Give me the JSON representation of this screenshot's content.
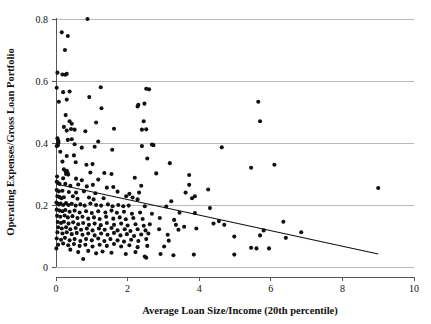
{
  "chart_data": {
    "type": "scatter",
    "title": "",
    "xlabel": "Average Loan Size/Income (20th percentile)",
    "ylabel": "Operating Expenses/Gross Loan Portfolio",
    "xlim": [
      0,
      10
    ],
    "ylim": [
      0,
      0.8
    ],
    "xticks": [
      0,
      2,
      4,
      6,
      8,
      10
    ],
    "yticks": [
      0,
      0.2,
      0.4,
      0.6,
      0.8
    ],
    "xtick_labels": [
      "0",
      "2",
      "4",
      "6",
      "8",
      "10"
    ],
    "ytick_labels": [
      "0",
      "0.2",
      "0.4",
      "0.6",
      "0.8"
    ],
    "grid": "horizontal",
    "legend": "none",
    "marker_color": "#111111",
    "marker_shape": "circle",
    "gridline_color": "#b8b8b8",
    "trendline": {
      "type": "linear-fit",
      "color": "#111111",
      "x_start": 0.0,
      "y_start": 0.268,
      "x_end": 9.0,
      "y_end": 0.042
    },
    "points": [
      [
        0.88,
        0.8
      ],
      [
        0.16,
        0.757
      ],
      [
        0.33,
        0.745
      ],
      [
        0.25,
        0.7
      ],
      [
        0.04,
        0.627
      ],
      [
        0.18,
        0.621
      ],
      [
        0.26,
        0.62
      ],
      [
        0.3,
        0.623
      ],
      [
        0.02,
        0.578
      ],
      [
        0.2,
        0.564
      ],
      [
        0.38,
        0.566
      ],
      [
        1.25,
        0.58
      ],
      [
        2.52,
        0.575
      ],
      [
        2.6,
        0.573
      ],
      [
        0.08,
        0.533
      ],
      [
        0.3,
        0.54
      ],
      [
        0.93,
        0.548
      ],
      [
        2.3,
        0.523
      ],
      [
        2.47,
        0.527
      ],
      [
        5.65,
        0.533
      ],
      [
        2.28,
        0.518
      ],
      [
        1.27,
        0.512
      ],
      [
        0.27,
        0.49
      ],
      [
        0.38,
        0.47
      ],
      [
        0.44,
        0.462
      ],
      [
        1.12,
        0.466
      ],
      [
        2.45,
        0.47
      ],
      [
        5.7,
        0.47
      ],
      [
        0.22,
        0.452
      ],
      [
        0.42,
        0.445
      ],
      [
        0.52,
        0.443
      ],
      [
        0.3,
        0.44
      ],
      [
        0.82,
        0.438
      ],
      [
        1.62,
        0.446
      ],
      [
        2.4,
        0.443
      ],
      [
        2.52,
        0.444
      ],
      [
        0.04,
        0.415
      ],
      [
        0.06,
        0.408
      ],
      [
        0.06,
        0.398
      ],
      [
        0.07,
        0.403
      ],
      [
        0.33,
        0.41
      ],
      [
        0.44,
        0.412
      ],
      [
        1.18,
        0.405
      ],
      [
        0.02,
        0.39
      ],
      [
        0.05,
        0.392
      ],
      [
        0.52,
        0.396
      ],
      [
        0.72,
        0.385
      ],
      [
        1.08,
        0.388
      ],
      [
        1.57,
        0.378
      ],
      [
        2.4,
        0.39
      ],
      [
        2.68,
        0.395
      ],
      [
        2.72,
        0.393
      ],
      [
        4.63,
        0.386
      ],
      [
        0.12,
        0.372
      ],
      [
        0.3,
        0.358
      ],
      [
        0.5,
        0.36
      ],
      [
        2.55,
        0.35
      ],
      [
        0.18,
        0.34
      ],
      [
        0.55,
        0.338
      ],
      [
        0.85,
        0.33
      ],
      [
        1.02,
        0.332
      ],
      [
        3.18,
        0.335
      ],
      [
        5.45,
        0.32
      ],
      [
        6.1,
        0.33
      ],
      [
        0.22,
        0.315
      ],
      [
        0.27,
        0.308
      ],
      [
        0.3,
        0.31
      ],
      [
        0.32,
        0.305
      ],
      [
        0.28,
        0.3
      ],
      [
        0.34,
        0.298
      ],
      [
        0.96,
        0.305
      ],
      [
        1.35,
        0.303
      ],
      [
        1.55,
        0.3
      ],
      [
        2.8,
        0.302
      ],
      [
        3.72,
        0.297
      ],
      [
        0.03,
        0.292
      ],
      [
        0.2,
        0.286
      ],
      [
        0.56,
        0.285
      ],
      [
        0.72,
        0.28
      ],
      [
        1.18,
        0.282
      ],
      [
        2.2,
        0.288
      ],
      [
        2.38,
        0.262
      ],
      [
        0.02,
        0.275
      ],
      [
        0.05,
        0.272
      ],
      [
        0.1,
        0.268
      ],
      [
        0.26,
        0.268
      ],
      [
        0.4,
        0.262
      ],
      [
        0.62,
        0.266
      ],
      [
        0.86,
        0.26
      ],
      [
        1.03,
        0.265
      ],
      [
        1.42,
        0.256
      ],
      [
        1.6,
        0.258
      ],
      [
        3.72,
        0.265
      ],
      [
        4.25,
        0.25
      ],
      [
        9.0,
        0.255
      ],
      [
        0.02,
        0.248
      ],
      [
        0.08,
        0.244
      ],
      [
        0.18,
        0.246
      ],
      [
        0.36,
        0.242
      ],
      [
        0.56,
        0.24
      ],
      [
        0.78,
        0.244
      ],
      [
        1.1,
        0.238
      ],
      [
        1.72,
        0.243
      ],
      [
        2.05,
        0.236
      ],
      [
        2.32,
        0.24
      ],
      [
        3.62,
        0.24
      ],
      [
        3.88,
        0.228
      ],
      [
        0.04,
        0.228
      ],
      [
        0.1,
        0.226
      ],
      [
        0.15,
        0.222
      ],
      [
        0.22,
        0.225
      ],
      [
        0.47,
        0.228
      ],
      [
        0.6,
        0.22
      ],
      [
        0.92,
        0.224
      ],
      [
        1.05,
        0.218
      ],
      [
        1.33,
        0.222
      ],
      [
        1.96,
        0.228
      ],
      [
        2.14,
        0.224
      ],
      [
        2.28,
        0.218
      ],
      [
        3.22,
        0.212
      ],
      [
        3.8,
        0.222
      ],
      [
        0.01,
        0.208
      ],
      [
        0.04,
        0.205
      ],
      [
        0.08,
        0.202
      ],
      [
        0.13,
        0.205
      ],
      [
        0.2,
        0.2
      ],
      [
        0.28,
        0.206
      ],
      [
        0.35,
        0.2
      ],
      [
        0.44,
        0.204
      ],
      [
        0.55,
        0.198
      ],
      [
        0.68,
        0.202
      ],
      [
        0.8,
        0.198
      ],
      [
        0.96,
        0.205
      ],
      [
        1.12,
        0.2
      ],
      [
        1.26,
        0.198
      ],
      [
        1.45,
        0.202
      ],
      [
        1.58,
        0.196
      ],
      [
        1.74,
        0.2
      ],
      [
        1.88,
        0.196
      ],
      [
        2.03,
        0.198
      ],
      [
        2.48,
        0.196
      ],
      [
        3.08,
        0.195
      ],
      [
        4.3,
        0.19
      ],
      [
        0.02,
        0.185
      ],
      [
        0.1,
        0.182
      ],
      [
        0.18,
        0.18
      ],
      [
        0.26,
        0.184
      ],
      [
        0.38,
        0.178
      ],
      [
        0.52,
        0.182
      ],
      [
        0.66,
        0.176
      ],
      [
        0.84,
        0.18
      ],
      [
        1.0,
        0.174
      ],
      [
        1.18,
        0.18
      ],
      [
        1.38,
        0.176
      ],
      [
        1.55,
        0.182
      ],
      [
        1.7,
        0.175
      ],
      [
        1.9,
        0.178
      ],
      [
        2.12,
        0.172
      ],
      [
        2.35,
        0.176
      ],
      [
        2.68,
        0.172
      ],
      [
        3.45,
        0.175
      ],
      [
        3.88,
        0.174
      ],
      [
        0.03,
        0.165
      ],
      [
        0.12,
        0.162
      ],
      [
        0.24,
        0.166
      ],
      [
        0.33,
        0.16
      ],
      [
        0.46,
        0.164
      ],
      [
        0.6,
        0.158
      ],
      [
        0.74,
        0.162
      ],
      [
        0.9,
        0.156
      ],
      [
        1.06,
        0.16
      ],
      [
        1.22,
        0.155
      ],
      [
        1.4,
        0.162
      ],
      [
        1.6,
        0.156
      ],
      [
        1.78,
        0.16
      ],
      [
        1.95,
        0.154
      ],
      [
        2.16,
        0.158
      ],
      [
        2.42,
        0.155
      ],
      [
        2.9,
        0.158
      ],
      [
        3.3,
        0.152
      ],
      [
        4.55,
        0.148
      ],
      [
        6.35,
        0.146
      ],
      [
        0.05,
        0.145
      ],
      [
        0.14,
        0.142
      ],
      [
        0.22,
        0.146
      ],
      [
        0.35,
        0.14
      ],
      [
        0.48,
        0.144
      ],
      [
        0.62,
        0.138
      ],
      [
        0.76,
        0.142
      ],
      [
        0.92,
        0.136
      ],
      [
        1.08,
        0.14
      ],
      [
        1.25,
        0.135
      ],
      [
        1.42,
        0.142
      ],
      [
        1.62,
        0.136
      ],
      [
        1.82,
        0.14
      ],
      [
        2.0,
        0.134
      ],
      [
        2.22,
        0.138
      ],
      [
        2.45,
        0.133
      ],
      [
        2.62,
        0.138
      ],
      [
        3.35,
        0.136
      ],
      [
        3.58,
        0.13
      ],
      [
        4.4,
        0.14
      ],
      [
        4.7,
        0.136
      ],
      [
        0.06,
        0.128
      ],
      [
        0.16,
        0.124
      ],
      [
        0.28,
        0.128
      ],
      [
        0.4,
        0.122
      ],
      [
        0.55,
        0.126
      ],
      [
        0.7,
        0.12
      ],
      [
        0.86,
        0.124
      ],
      [
        1.02,
        0.118
      ],
      [
        1.2,
        0.124
      ],
      [
        1.36,
        0.12
      ],
      [
        1.55,
        0.126
      ],
      [
        1.72,
        0.118
      ],
      [
        1.92,
        0.122
      ],
      [
        2.08,
        0.116
      ],
      [
        2.28,
        0.122
      ],
      [
        2.5,
        0.118
      ],
      [
        2.88,
        0.122
      ],
      [
        3.42,
        0.12
      ],
      [
        3.92,
        0.124
      ],
      [
        5.8,
        0.118
      ],
      [
        6.85,
        0.112
      ],
      [
        0.04,
        0.112
      ],
      [
        0.18,
        0.108
      ],
      [
        0.3,
        0.112
      ],
      [
        0.44,
        0.106
      ],
      [
        0.58,
        0.11
      ],
      [
        0.74,
        0.104
      ],
      [
        0.9,
        0.108
      ],
      [
        1.08,
        0.102
      ],
      [
        1.26,
        0.108
      ],
      [
        1.44,
        0.104
      ],
      [
        1.62,
        0.11
      ],
      [
        1.8,
        0.102
      ],
      [
        1.98,
        0.106
      ],
      [
        2.18,
        0.1
      ],
      [
        2.38,
        0.105
      ],
      [
        2.58,
        0.108
      ],
      [
        3.12,
        0.104
      ],
      [
        4.98,
        0.098
      ],
      [
        5.7,
        0.102
      ],
      [
        6.42,
        0.094
      ],
      [
        0.02,
        0.092
      ],
      [
        0.14,
        0.088
      ],
      [
        0.25,
        0.094
      ],
      [
        0.38,
        0.086
      ],
      [
        0.52,
        0.09
      ],
      [
        0.68,
        0.084
      ],
      [
        0.84,
        0.09
      ],
      [
        1.0,
        0.086
      ],
      [
        1.18,
        0.092
      ],
      [
        1.35,
        0.084
      ],
      [
        1.52,
        0.09
      ],
      [
        1.72,
        0.086
      ],
      [
        1.9,
        0.082
      ],
      [
        2.1,
        0.088
      ],
      [
        2.3,
        0.084
      ],
      [
        2.52,
        0.09
      ],
      [
        3.15,
        0.085
      ],
      [
        0.06,
        0.072
      ],
      [
        0.2,
        0.076
      ],
      [
        0.34,
        0.07
      ],
      [
        0.5,
        0.074
      ],
      [
        0.66,
        0.068
      ],
      [
        0.82,
        0.072
      ],
      [
        1.02,
        0.066
      ],
      [
        1.22,
        0.072
      ],
      [
        1.42,
        0.068
      ],
      [
        1.62,
        0.074
      ],
      [
        1.82,
        0.066
      ],
      [
        2.05,
        0.07
      ],
      [
        2.28,
        0.064
      ],
      [
        2.55,
        0.068
      ],
      [
        3.02,
        0.066
      ],
      [
        5.45,
        0.062
      ],
      [
        5.6,
        0.06
      ],
      [
        5.95,
        0.06
      ],
      [
        0.01,
        0.06
      ],
      [
        0.4,
        0.056
      ],
      [
        0.62,
        0.048
      ],
      [
        0.9,
        0.052
      ],
      [
        1.12,
        0.044
      ],
      [
        1.3,
        0.05
      ],
      [
        1.55,
        0.046
      ],
      [
        1.95,
        0.042
      ],
      [
        2.22,
        0.048
      ],
      [
        2.48,
        0.034
      ],
      [
        2.52,
        0.03
      ],
      [
        2.92,
        0.042
      ],
      [
        3.28,
        0.038
      ],
      [
        3.85,
        0.04
      ],
      [
        4.98,
        0.04
      ],
      [
        0.76,
        0.026
      ]
    ]
  },
  "axes": {
    "x_title": "Average Loan Size/Income (20th percentile)",
    "y_title": "Operating Expenses/Gross Loan Portfolio"
  }
}
